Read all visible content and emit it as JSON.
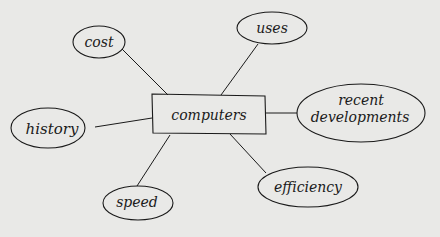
{
  "diagram": {
    "type": "mind-map",
    "center": {
      "label": "computers",
      "x": 152,
      "y": 95,
      "w": 114,
      "h": 39
    },
    "nodes": [
      {
        "id": "cost",
        "label": "cost",
        "cx": 99,
        "cy": 42,
        "rx": 26,
        "ry": 16
      },
      {
        "id": "uses",
        "label": "uses",
        "cx": 272,
        "cy": 28,
        "rx": 35,
        "ry": 16
      },
      {
        "id": "recent-developments",
        "label1": "recent",
        "label2": "developments",
        "cx": 360,
        "cy": 112,
        "rx": 64,
        "ry": 28
      },
      {
        "id": "history",
        "label": "history",
        "cx": 48,
        "cy": 128,
        "rx": 37,
        "ry": 20
      },
      {
        "id": "speed",
        "label": "speed",
        "cx": 138,
        "cy": 203,
        "rx": 35,
        "ry": 17
      },
      {
        "id": "efficiency",
        "label": "efficiency",
        "cx": 308,
        "cy": 187,
        "rx": 50,
        "ry": 20
      }
    ],
    "colors": {
      "background": "#e9e9e7",
      "ink": "#1a1a1a"
    }
  }
}
